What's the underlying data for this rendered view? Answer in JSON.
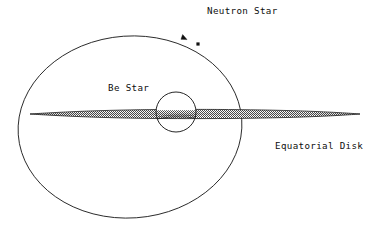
{
  "figure": {
    "kind": "astronomical-schematic",
    "title_visible": false,
    "background_color": "#ffffff",
    "line_color": "#1a1a1a",
    "disk_fill_color": "#b4b4b4",
    "text_color": "#0d0d0d"
  },
  "labels": {
    "neutron_star": "Neutron Star",
    "be_star": "Be Star",
    "equatorial_disk": "Equatorial Disk"
  },
  "objects": {
    "orbit": {
      "name": "orbit-ellipse",
      "center_x": 130,
      "center_y": 127,
      "radius_x": 112,
      "radius_y": 91,
      "rotation_deg": -4,
      "stroke_width": 0.9
    },
    "be_star": {
      "name": "be-star-circle",
      "center_x": 176,
      "center_y": 112,
      "radius": 20,
      "stroke_width": 0.9
    },
    "neutron_star_marker": {
      "name": "neutron-star-dot",
      "x": 198,
      "y": 44,
      "size": 3.2
    },
    "orbit_direction_arrow": {
      "name": "orbit-direction-arrowhead",
      "x": 186,
      "y": 39,
      "angle_deg": 28,
      "size": 5.5
    },
    "equatorial_disk": {
      "name": "equatorial-disk-lens",
      "left_tip_x": 30,
      "right_tip_x": 360,
      "axis_y": 114,
      "max_half_thickness": 4.2
    }
  },
  "label_positions": {
    "neutron_star": {
      "x": 207,
      "y": 14
    },
    "be_star": {
      "x": 108,
      "y": 91
    },
    "equatorial_disk": {
      "x": 275,
      "y": 149
    }
  }
}
